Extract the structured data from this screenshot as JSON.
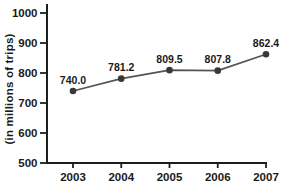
{
  "chart_data": {
    "type": "line",
    "ylabel": "(in millions of trips)",
    "x": [
      "2003",
      "2004",
      "2005",
      "2006",
      "2007"
    ],
    "series": [
      {
        "name": "trips",
        "values": [
          740.0,
          781.2,
          809.5,
          807.8,
          862.4
        ]
      }
    ],
    "point_labels": [
      "740.0",
      "781.2",
      "809.5",
      "807.8",
      "862.4"
    ],
    "ylim": [
      500,
      1000
    ],
    "ytick_step": 100,
    "ytick_labels": [
      "500",
      "600",
      "700",
      "800",
      "900",
      "1000"
    ],
    "grid": false,
    "legend_position": "none",
    "colors": {
      "line": "#545454",
      "marker": "#383838",
      "axis": "#1e1e1e",
      "text": "#1a1a1a",
      "background": "#ffffff"
    }
  }
}
